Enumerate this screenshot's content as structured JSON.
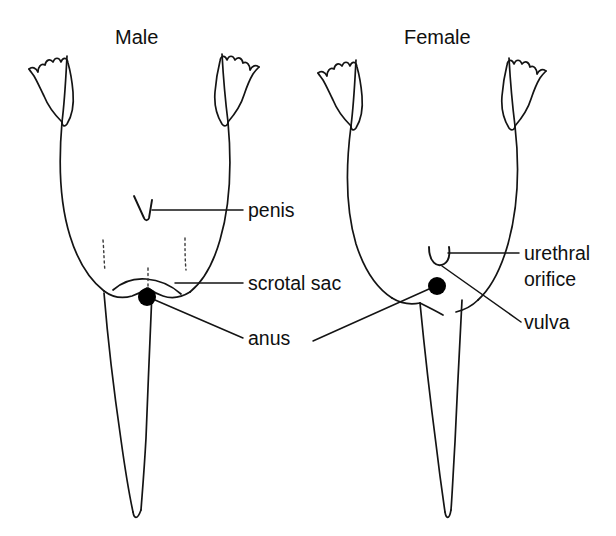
{
  "figure": {
    "title_male": "Male",
    "title_female": "Female",
    "background_color": "#ffffff",
    "ink_color": "#141414"
  },
  "male": {
    "heading": "Male",
    "labels": [
      {
        "id": "penis",
        "text": "penis"
      },
      {
        "id": "scrotal-sac",
        "text": "scrotal sac"
      },
      {
        "id": "anus",
        "text": "anus"
      }
    ]
  },
  "female": {
    "heading": "Female",
    "labels": [
      {
        "id": "urethral-orifice",
        "text_line1": "urethral",
        "text_line2": "orifice"
      },
      {
        "id": "vulva",
        "text": "vulva"
      },
      {
        "id": "anus",
        "text": "anus"
      }
    ]
  },
  "shared_labels": {
    "anus": "anus"
  },
  "markers": {
    "male_penis_shape": "v-notch",
    "male_anus_shape": "filled-circle",
    "female_urethral_shape": "u-cup",
    "female_anus_shape": "filled-circle",
    "scrotal_sac_shape": "dotted-vertical-ticks"
  }
}
